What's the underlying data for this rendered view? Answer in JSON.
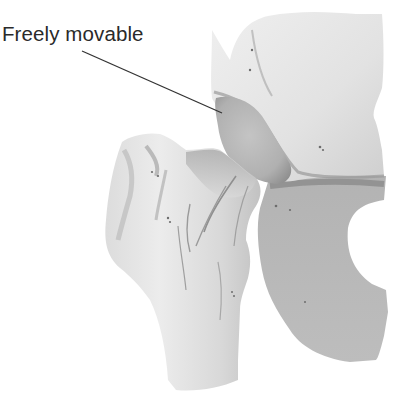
{
  "figure": {
    "annotations": [
      {
        "label": "Freely movable",
        "points_to": "femoral head in acetabulum"
      }
    ],
    "parts": [
      {
        "name": "pelvis-ilium",
        "shade": "light gray"
      },
      {
        "name": "femoral-head",
        "shade": "medium gray"
      },
      {
        "name": "ischium",
        "shade": "medium gray"
      },
      {
        "name": "femur",
        "shade": "light gray"
      }
    ],
    "colors": {
      "background": "#ffffff",
      "label_text": "#2a2a2a",
      "leader_line": "#333333",
      "bone_light": "#e6e6e6",
      "bone_mid": "#c9c9c9",
      "bone_dark": "#a8a8a8",
      "shadow": "#8a8a8a"
    }
  }
}
